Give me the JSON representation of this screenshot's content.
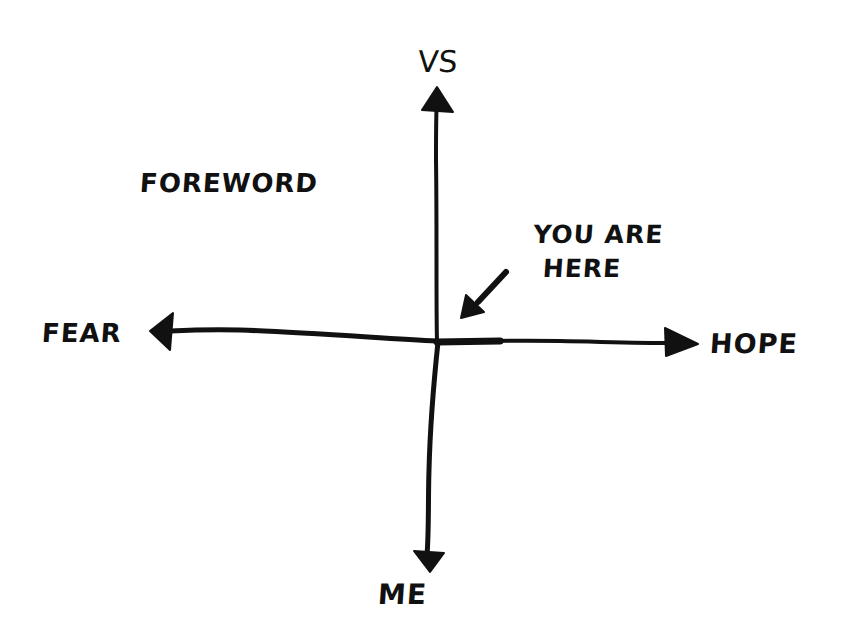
{
  "diagram": {
    "style": "hand-drawn ink sketch on white",
    "colors": {
      "background": "#ffffff",
      "ink": "#111111"
    },
    "axes": {
      "vertical": {
        "top_label": "VS",
        "bottom_label": "ME"
      },
      "horizontal": {
        "left_label": "FEAR",
        "right_label": "HOPE"
      }
    },
    "title_label": "FOREWORD",
    "marker": {
      "line1": "YOU ARE",
      "line2": "HERE",
      "arrow_direction": "down-left toward origin"
    }
  }
}
